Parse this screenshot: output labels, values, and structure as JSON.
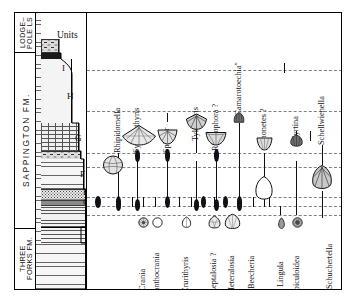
{
  "chart_data": {
    "type": "range-chart",
    "xlabel": "",
    "ylabel": "Units",
    "grid": "horizontal dashed datum lines",
    "legend": null,
    "formations": [
      {
        "name": "LODGE-\nPOLE LS",
        "top_px": 12,
        "bottom_px": 52
      },
      {
        "name": "SAPPINGTON FM.",
        "top_px": 52,
        "bottom_px": 228
      },
      {
        "name": "THREE\nFORKS FM.",
        "top_px": 228,
        "bottom_px": 290
      }
    ],
    "units_header": "Units",
    "units": [
      {
        "label": "I",
        "y": 70
      },
      {
        "label": "H",
        "y": 98
      },
      {
        "label": "G",
        "y": 140
      },
      {
        "label": "F",
        "y": 175
      },
      {
        "label": "E",
        "y": 197
      },
      {
        "label": "C",
        "y": 206
      },
      {
        "label": "D",
        "y": 202
      },
      {
        "label": "B",
        "y": 212
      },
      {
        "label": "A",
        "y": 224
      }
    ],
    "datum_lines_y": [
      69,
      110,
      152,
      166,
      196,
      205,
      214
    ],
    "taxa_upper": [
      {
        "name": "Rhipidomella",
        "x": 118,
        "label_bottom": 152,
        "bar_top": 160,
        "bar_bottom": 205,
        "fossil": "rhipidomella",
        "fossil_y": 150,
        "has_spindle": false
      },
      {
        "name": "Syringothyris",
        "x": 137,
        "label_bottom": 148,
        "bar_top": 152,
        "bar_bottom": 205,
        "fossil": "syringothyris",
        "fossil_y": 146,
        "has_spindle": true
      },
      {
        "name": "Spirifer",
        "x": 167,
        "label_bottom": 150,
        "bar_top": 150,
        "bar_bottom": 205,
        "fossil": "spirifer",
        "fossil_y": 147,
        "has_spindle": true
      },
      {
        "name": "Tylothyris",
        "x": 196,
        "label_bottom": 138,
        "bar_top": 140,
        "bar_bottom": 205,
        "fossil": "tylothyris",
        "fossil_y": 134,
        "has_spindle": false
      },
      {
        "name": "Rhytiophora ?",
        "x": 216,
        "label_bottom": 146,
        "bar_top": 150,
        "bar_bottom": 205,
        "fossil": "rhytiophora",
        "fossil_y": 145,
        "has_spindle": true
      },
      {
        "name": "\"Camarotoechia\"",
        "x": 239,
        "label_bottom": 118,
        "bar_top": 122,
        "bar_bottom": 205,
        "fossil": "camarotoechia",
        "fossil_y": 116,
        "has_spindle": false
      },
      {
        "name": "Chonetes ?",
        "x": 264,
        "label_bottom": 140,
        "bar_top": 108,
        "bar_bottom": 205,
        "fossil": "chonetes",
        "fossil_y": 150,
        "has_spindle": false
      },
      {
        "name": "Cyrtina",
        "x": 296,
        "label_bottom": 144,
        "bar_top": 152,
        "bar_bottom": 205,
        "fossil": "cyrtina",
        "fossil_y": 142,
        "has_spindle": false
      },
      {
        "name": "Schellwienella",
        "x": 322,
        "label_bottom": 140,
        "bar_top": 140,
        "bar_bottom": 205,
        "fossil": "schellwienella",
        "fossil_y": 168,
        "has_spindle": false
      }
    ],
    "taxa_lower": [
      {
        "name": "Crania",
        "x": 143,
        "fossil": "crania"
      },
      {
        "name": "Acanthocrania",
        "x": 157,
        "fossil": "acanthocrania"
      },
      {
        "name": "Crurithyris",
        "x": 186,
        "fossil": "crurithyris"
      },
      {
        "name": "Leptalosia ?",
        "x": 214,
        "fossil": "leptalosia"
      },
      {
        "name": "Heteralosia",
        "x": 232,
        "fossil": "heteralosia"
      },
      {
        "name": "Beecheria",
        "x": 252,
        "fossil": null
      },
      {
        "name": "Lingula",
        "x": 281,
        "fossil": "lingula"
      },
      {
        "name": "Orbiculoidea",
        "x": 297,
        "fossil": "orbiculoidea"
      },
      {
        "name": "Schuchertella",
        "x": 330,
        "fossil": null
      }
    ],
    "lithology": [
      {
        "unit": "I",
        "top": 40,
        "bottom": 54,
        "pattern": "p-cong",
        "right": 22,
        "desc": "conglomerate"
      },
      {
        "unit": "I-b",
        "top": 54,
        "bottom": 60,
        "pattern": "p-black",
        "right": 24,
        "desc": "black shale"
      },
      {
        "unit": "H",
        "top": 60,
        "bottom": 124,
        "pattern": "p-dots",
        "right": 36,
        "desc": "siltstone / sandstone"
      },
      {
        "unit": "G",
        "top": 124,
        "bottom": 152,
        "pattern": "p-brick",
        "right": 42,
        "desc": "limestone"
      },
      {
        "unit": "G2",
        "top": 152,
        "bottom": 160,
        "pattern": "p-cong",
        "right": 44,
        "desc": "pebbly bed"
      },
      {
        "unit": "F",
        "top": 160,
        "bottom": 190,
        "pattern": "p-shale-w",
        "right": 48,
        "desc": "shaly siltstone"
      },
      {
        "unit": "E",
        "top": 190,
        "bottom": 200,
        "pattern": "p-dots-dense",
        "right": 50,
        "desc": "sandstone"
      },
      {
        "unit": "C",
        "top": 200,
        "bottom": 207,
        "pattern": "p-dark",
        "right": 50,
        "desc": "dark shale"
      },
      {
        "unit": "B",
        "top": 207,
        "bottom": 228,
        "pattern": "p-shale",
        "right": 50,
        "desc": "shale"
      },
      {
        "unit": "A",
        "top": 228,
        "bottom": 244,
        "pattern": "p-wavy",
        "right": 50,
        "desc": "wavy bedded shale"
      },
      {
        "unit": "TF",
        "top": 244,
        "bottom": 278,
        "pattern": "p-shale-w",
        "right": 51,
        "desc": "Three Forks shale"
      }
    ]
  },
  "colors": {
    "ink": "#111111",
    "datum": "#6f6f8a",
    "paper": "#ffffff"
  }
}
